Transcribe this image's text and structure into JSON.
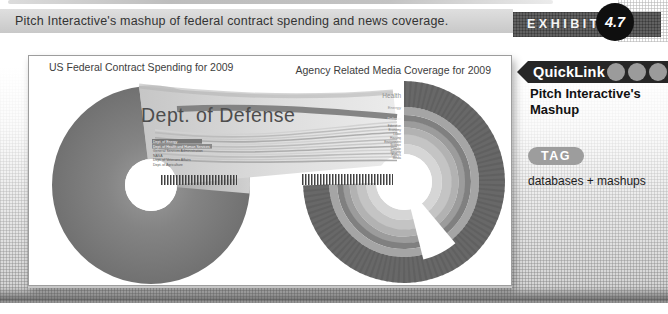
{
  "header": {
    "title": "Pitch Interactive's mashup of federal contract spending and news coverage.",
    "exhibit_label": "EXHIBIT",
    "exhibit_number": "4.7"
  },
  "sidebar": {
    "quicklink_label": "QuickLink",
    "link_line1": "Pitch Interactive's",
    "link_line2": "Mashup",
    "tag_label": "TAG",
    "tag_value": "databases + mashups"
  },
  "figure": {
    "left_chart": {
      "title": "US Federal Contract Spending for 2009",
      "main_segment": "Dept. of Defense",
      "small_labels": [
        "Dept. of Energy",
        "Dept. of Health and Human Services",
        "General Services Administration",
        "NASA",
        "Dept. of Veterans Affairs",
        "Dept. of Agriculture"
      ]
    },
    "right_chart": {
      "title": "Agency Related Media Coverage for 2009",
      "top_labels": [
        "Health",
        "Energy",
        "Defense"
      ],
      "small_labels": [
        "Education",
        "Economy",
        "Labor",
        "Housing",
        "Environment",
        "Science",
        "Climate",
        "Security",
        "Politics",
        "Media"
      ]
    }
  },
  "colors": {
    "badge_black": "#262626",
    "pill_gray": "#9d9d9d",
    "left_donut_gray": "#7a7a7a",
    "outer_ring_gray": "#686868"
  }
}
